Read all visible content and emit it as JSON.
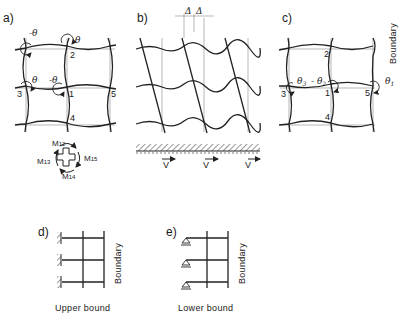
{
  "figure": {
    "panels": [
      {
        "id": "a",
        "label": "a)",
        "nodes": [
          "1",
          "2",
          "3",
          "4",
          "5"
        ],
        "rotations": [
          "-θ",
          "θ",
          "θ",
          "-θ"
        ],
        "moments": [
          "M12",
          "M13",
          "M14",
          "M15"
        ],
        "moment_labels": {
          "m12_main": "M",
          "m12_sub": "12",
          "m13_main": "M",
          "m13_sub": "13",
          "m14_main": "M",
          "m14_sub": "14",
          "m15_main": "M",
          "m15_sub": "15"
        }
      },
      {
        "id": "b",
        "label": "b)",
        "delta": [
          "Δ",
          "Δ"
        ],
        "velocity": [
          "V",
          "V",
          "V"
        ]
      },
      {
        "id": "c",
        "label": "c)",
        "nodes": [
          "1",
          "2",
          "3",
          "4",
          "5"
        ],
        "rotations": {
          "theta3": "θ3",
          "theta2": "-θ2",
          "theta1": "θ1"
        },
        "boundary": "Boundary"
      },
      {
        "id": "d",
        "label": "d)",
        "caption": "Upper bound",
        "boundary": "Boundary"
      },
      {
        "id": "e",
        "label": "e)",
        "caption": "Lower bound",
        "boundary": "Boundary"
      }
    ]
  },
  "a": {
    "label": "a)",
    "n1": "1",
    "n2": "2",
    "n3": "3",
    "n4": "4",
    "n5": "5",
    "r_neg1": "-θ",
    "r_pos1": "θ",
    "r_pos2": "θ",
    "r_neg2": "-θ"
  },
  "b": {
    "label": "b)",
    "d1": "Δ",
    "d2": "Δ",
    "v1": "V",
    "v2": "V",
    "v3": "V"
  },
  "c": {
    "label": "c)",
    "n1": "1",
    "n2": "2",
    "n3": "3",
    "n4": "4",
    "n5": "5",
    "t3": "θ",
    "t3s": "3",
    "t2": "- θ",
    "t2s": "2",
    "t1": "θ",
    "t1s": "1",
    "boundary": "Boundary"
  },
  "d": {
    "label": "d)",
    "caption": "Upper bound",
    "boundary": "Boundary"
  },
  "e": {
    "label": "e)",
    "caption": "Lower bound",
    "boundary": "Boundary"
  },
  "m": {
    "M": "M",
    "s12": "12",
    "s13": "13",
    "s14": "14",
    "s15": "15"
  }
}
